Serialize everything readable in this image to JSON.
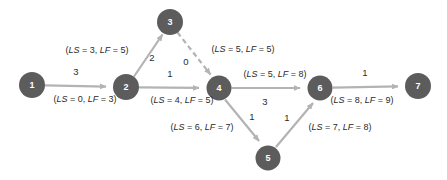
{
  "diagram": {
    "type": "activity-on-arrow-network",
    "colors": {
      "node_fill": "#5c5c5c",
      "node_text": "#ffffff",
      "edge_stroke": "#b3b3b3",
      "label_text": "#2b2b2b",
      "background": "#ffffff"
    },
    "nodes": [
      {
        "id": "1",
        "label": "1",
        "cx": 32,
        "cy": 85,
        "r": 13
      },
      {
        "id": "2",
        "label": "2",
        "cx": 126,
        "cy": 87,
        "r": 13
      },
      {
        "id": "3",
        "label": "3",
        "cx": 170,
        "cy": 22,
        "r": 13
      },
      {
        "id": "4",
        "label": "4",
        "cx": 219,
        "cy": 88,
        "r": 12.5
      },
      {
        "id": "5",
        "label": "5",
        "cx": 268,
        "cy": 158,
        "r": 12.5
      },
      {
        "id": "6",
        "label": "6",
        "cx": 320,
        "cy": 88,
        "r": 12.5
      },
      {
        "id": "7",
        "label": "7",
        "cx": 418,
        "cy": 86,
        "r": 13
      }
    ],
    "edges": [
      {
        "id": "e12",
        "from": "1",
        "to": "2",
        "style": "solid",
        "weight": "3",
        "annotation": "(LS = 3, LF = 5)",
        "ls": "3",
        "lf": "5",
        "annotation_prefix": "(",
        "annotation_suffix": ")"
      },
      {
        "id": "e12b",
        "from": "1",
        "to": "2",
        "style": "solid",
        "weight": "3",
        "annotation": "(LS = 0, LF = 3)",
        "ls": "0",
        "lf": "3"
      },
      {
        "id": "e23",
        "from": "2",
        "to": "3",
        "style": "solid",
        "weight": "2",
        "annotation": "(LS = 3, LF = 5)",
        "ls": "3",
        "lf": "5"
      },
      {
        "id": "e34",
        "from": "3",
        "to": "4",
        "style": "dashed",
        "weight": "0",
        "annotation": "(LS = 5, LF = 5)",
        "ls": "5",
        "lf": "5"
      },
      {
        "id": "e24",
        "from": "2",
        "to": "4",
        "style": "solid",
        "weight": "1",
        "annotation": "(LS = 4, LF = 5)",
        "ls": "4",
        "lf": "5"
      },
      {
        "id": "e46",
        "from": "4",
        "to": "6",
        "style": "solid",
        "weight": "3",
        "annotation": "(LS = 5, LF = 8)",
        "ls": "5",
        "lf": "8"
      },
      {
        "id": "e45",
        "from": "4",
        "to": "5",
        "style": "solid",
        "weight": "1",
        "annotation": "(LS = 6, LF = 7)",
        "ls": "6",
        "lf": "7"
      },
      {
        "id": "e56",
        "from": "5",
        "to": "6",
        "style": "solid",
        "weight": "1",
        "annotation": "(LS = 7, LF = 8)",
        "ls": "7",
        "lf": "8"
      },
      {
        "id": "e67",
        "from": "6",
        "to": "7",
        "style": "solid",
        "weight": "1",
        "annotation": "(LS = 8, LF = 9)",
        "ls": "8",
        "lf": "9"
      }
    ],
    "labels": {
      "w_1_2": "3",
      "w_2_3": "2",
      "w_2_4": "1",
      "w_3_4": "0",
      "w_4_6": "3",
      "w_4_5": "1",
      "w_5_6": "1",
      "w_6_7": "1",
      "a_1_2": "(LS = 0, LF = 3)",
      "a_2_3": "(LS = 3, LF = 5)",
      "a_2_4": "(LS = 4, LF = 5)",
      "a_3_4": "(LS = 5, LF = 5)",
      "a_4_6": "(LS = 5, LF = 8)",
      "a_4_5": "(LS = 6, LF = 7)",
      "a_5_6": "(LS = 7, LF = 8)",
      "a_6_7": "(LS = 8, LF = 9)"
    }
  }
}
